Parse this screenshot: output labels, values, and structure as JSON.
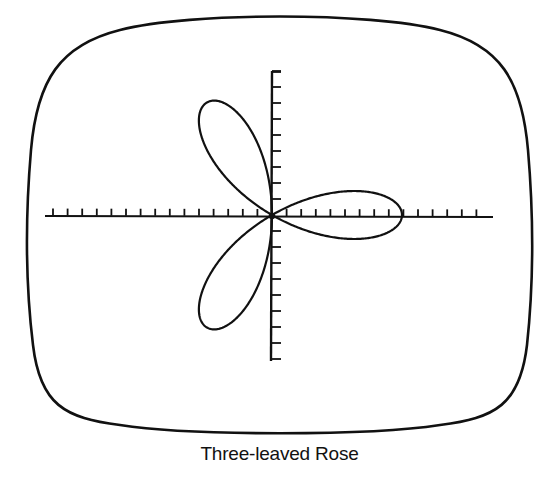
{
  "caption": "Three-leaved Rose",
  "colors": {
    "ink": "#111111",
    "background": "#ffffff"
  },
  "frame": {
    "shape": "rounded-tv-screen",
    "stroke_width": 2.6
  },
  "chart_data": {
    "type": "line",
    "subtype": "polar-curve",
    "title": "Three-leaved Rose",
    "equation": "r = a cos(3θ)",
    "petals": 3,
    "petal_directions_deg": [
      0,
      120,
      240
    ],
    "origin_px": [
      272,
      215
    ],
    "amplitude_px": 130,
    "x_axis": {
      "from_px": 45,
      "to_px": 493,
      "y_px": 216,
      "tick_spacing_px": 14.6,
      "tick_side": "up",
      "tick_labels": []
    },
    "y_axis": {
      "from_px": 71,
      "to_px": 361,
      "x_px": 272,
      "tick_spacing_px": 16.0,
      "tick_side": "right",
      "tick_labels": []
    },
    "grid": false,
    "legend": null,
    "xlabel": "",
    "ylabel": ""
  }
}
